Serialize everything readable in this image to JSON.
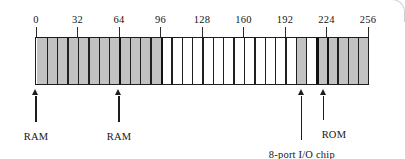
{
  "figure": {
    "axis": {
      "ticks": [
        {
          "label": "0",
          "value": 0
        },
        {
          "label": "32",
          "value": 32
        },
        {
          "label": "64",
          "value": 64
        },
        {
          "label": "96",
          "value": 96
        },
        {
          "label": "128",
          "value": 128
        },
        {
          "label": "160",
          "value": 160
        },
        {
          "label": "192",
          "value": 192
        },
        {
          "label": "224",
          "value": 224
        },
        {
          "label": "256",
          "value": 256
        }
      ],
      "min": 0,
      "max": 256
    },
    "bar": {
      "segment_count": 32,
      "segment_size": 8,
      "shaded_color": "#c2c2c2",
      "blank_color": "#ffffff",
      "outline_color": "#1c1c1c",
      "segments": [
        {
          "start": 0,
          "end": 8,
          "state": "shaded"
        },
        {
          "start": 8,
          "end": 16,
          "state": "shaded"
        },
        {
          "start": 16,
          "end": 24,
          "state": "shaded"
        },
        {
          "start": 24,
          "end": 32,
          "state": "shaded"
        },
        {
          "start": 32,
          "end": 40,
          "state": "shaded"
        },
        {
          "start": 40,
          "end": 48,
          "state": "shaded"
        },
        {
          "start": 48,
          "end": 56,
          "state": "shaded"
        },
        {
          "start": 56,
          "end": 64,
          "state": "shaded"
        },
        {
          "start": 64,
          "end": 72,
          "state": "shaded"
        },
        {
          "start": 72,
          "end": 80,
          "state": "shaded"
        },
        {
          "start": 80,
          "end": 88,
          "state": "shaded"
        },
        {
          "start": 88,
          "end": 96,
          "state": "shaded"
        },
        {
          "start": 96,
          "end": 104,
          "state": "blank"
        },
        {
          "start": 104,
          "end": 112,
          "state": "blank"
        },
        {
          "start": 112,
          "end": 120,
          "state": "blank"
        },
        {
          "start": 120,
          "end": 128,
          "state": "blank"
        },
        {
          "start": 128,
          "end": 136,
          "state": "blank"
        },
        {
          "start": 136,
          "end": 144,
          "state": "blank"
        },
        {
          "start": 144,
          "end": 152,
          "state": "blank"
        },
        {
          "start": 152,
          "end": 160,
          "state": "blank"
        },
        {
          "start": 160,
          "end": 168,
          "state": "blank"
        },
        {
          "start": 168,
          "end": 176,
          "state": "blank"
        },
        {
          "start": 176,
          "end": 184,
          "state": "blank"
        },
        {
          "start": 184,
          "end": 192,
          "state": "blank"
        },
        {
          "start": 192,
          "end": 200,
          "state": "blank"
        },
        {
          "start": 200,
          "end": 208,
          "state": "shaded"
        },
        {
          "start": 208,
          "end": 216,
          "state": "blank"
        },
        {
          "start": 216,
          "end": 224,
          "state": "shaded"
        },
        {
          "start": 224,
          "end": 232,
          "state": "shaded"
        },
        {
          "start": 232,
          "end": 240,
          "state": "shaded"
        },
        {
          "start": 240,
          "end": 248,
          "state": "shaded"
        },
        {
          "start": 248,
          "end": 256,
          "state": "shaded"
        }
      ],
      "major_dividers": [
        0,
        64,
        96,
        216,
        224,
        256
      ]
    },
    "callouts": [
      {
        "label": "RAM",
        "value": 0,
        "label_offset_x": 0,
        "stem_height": 26,
        "label_y": 131
      },
      {
        "label": "RAM",
        "value": 64,
        "label_offset_x": 0,
        "stem_height": 26,
        "label_y": 131
      },
      {
        "label": "8-port I/O chip",
        "value": 205,
        "label_offset_x": 0,
        "stem_height": 44,
        "label_y": 149
      },
      {
        "label": "ROM",
        "value": 222,
        "label_offset_x": 10,
        "stem_height": 24,
        "label_y": 129
      }
    ]
  }
}
